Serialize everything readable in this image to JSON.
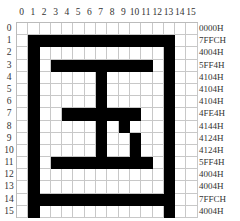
{
  "diagram": {
    "column_labels": [
      "0",
      "1",
      "2",
      "3",
      "4",
      "5",
      "6",
      "7",
      "8",
      "9",
      "10",
      "11",
      "12",
      "13",
      "14",
      "15"
    ],
    "row_labels": [
      "0",
      "1",
      "2",
      "3",
      "4",
      "5",
      "6",
      "7",
      "8",
      "9",
      "10",
      "11",
      "12",
      "13",
      "14",
      "15"
    ],
    "hex_codes": [
      "0000H",
      "7FFCH",
      "4004H",
      "5FF4H",
      "4104H",
      "4104H",
      "4104H",
      "4FE4H",
      "4144H",
      "4124H",
      "4124H",
      "5FF4H",
      "4004H",
      "4004H",
      "7FFCH",
      "4004H"
    ],
    "colors": {
      "filled": "#000000",
      "empty": "#ffffff",
      "grid_line": "#c8c8c8"
    }
  }
}
